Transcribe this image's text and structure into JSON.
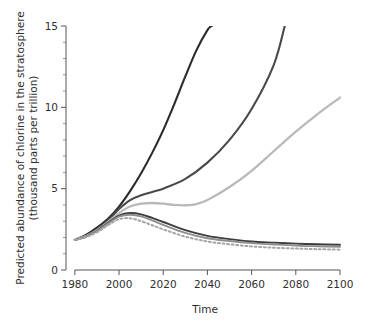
{
  "chart_data": {
    "type": "line",
    "title": "",
    "subtitle": "",
    "xlabel": "Time",
    "ylabel": "Predicted abundance of chlorine in the stratosphere (thousand parts per trillion)",
    "ylabel_line1": "Predicted abundance of chlorine in the stratosphere",
    "ylabel_line2": "(thousand parts per trillion)",
    "xlim": [
      1976,
      2100
    ],
    "ylim": [
      0,
      15
    ],
    "xticks": [
      1980,
      2000,
      2020,
      2040,
      2060,
      2080,
      2100
    ],
    "xtick_labels": [
      "1980",
      "2000",
      "2020",
      "2040",
      "2060",
      "2080",
      "2100"
    ],
    "yticks": [
      0,
      5,
      10,
      15
    ],
    "ytick_labels": [
      "0",
      "5",
      "10",
      "15"
    ],
    "yticks_minor": [
      1,
      2,
      3,
      4,
      6,
      7,
      8,
      9,
      11,
      12,
      13,
      14
    ],
    "grid": false,
    "legend": "none",
    "legend_position": "none",
    "series": [
      {
        "name": "no-protocol",
        "color": "#2b2b2b",
        "width": 2.1,
        "dash": "none",
        "clipped_at_top": true,
        "x": [
          1980,
          1985,
          1990,
          1995,
          2000,
          2005,
          2010,
          2015,
          2020,
          2025,
          2030,
          2035,
          2040,
          2042
        ],
        "y": [
          1.85,
          2.15,
          2.6,
          3.15,
          3.9,
          4.85,
          5.95,
          7.2,
          8.6,
          10.2,
          11.9,
          13.5,
          14.75,
          15.0
        ]
      },
      {
        "name": "montreal-1987",
        "color": "#4a4a4a",
        "width": 2.1,
        "dash": "none",
        "clipped_at_top": true,
        "x": [
          1980,
          1985,
          1990,
          1995,
          2000,
          2005,
          2010,
          2015,
          2020,
          2030,
          2040,
          2050,
          2060,
          2070,
          2075
        ],
        "y": [
          1.85,
          2.1,
          2.5,
          3.05,
          3.75,
          4.3,
          4.6,
          4.8,
          5.0,
          5.6,
          6.6,
          8.0,
          9.9,
          12.6,
          15.0
        ]
      },
      {
        "name": "london-1990",
        "color": "#b9b9b9",
        "width": 2.3,
        "dash": "none",
        "clipped_at_top": false,
        "x": [
          1980,
          1985,
          1990,
          1995,
          2000,
          2005,
          2010,
          2015,
          2020,
          2025,
          2030,
          2035,
          2040,
          2050,
          2060,
          2070,
          2080,
          2090,
          2100
        ],
        "y": [
          1.85,
          2.08,
          2.45,
          2.95,
          3.5,
          3.9,
          4.08,
          4.12,
          4.08,
          4.0,
          3.98,
          4.05,
          4.3,
          5.1,
          6.1,
          7.3,
          8.5,
          9.6,
          10.6
        ]
      },
      {
        "name": "copenhagen-1992",
        "color": "#3d3d3d",
        "width": 1.9,
        "dash": "none",
        "clipped_at_top": false,
        "x": [
          1980,
          1985,
          1990,
          1995,
          2000,
          2005,
          2010,
          2015,
          2020,
          2030,
          2040,
          2050,
          2060,
          2070,
          2080,
          2090,
          2100
        ],
        "y": [
          1.85,
          2.05,
          2.4,
          2.9,
          3.35,
          3.5,
          3.42,
          3.2,
          2.95,
          2.45,
          2.1,
          1.9,
          1.75,
          1.68,
          1.62,
          1.58,
          1.55
        ]
      },
      {
        "name": "vienna-1995",
        "color": "#8e8e8e",
        "width": 1.9,
        "dash": "none",
        "clipped_at_top": false,
        "x": [
          1980,
          1985,
          1990,
          1995,
          2000,
          2005,
          2010,
          2015,
          2020,
          2030,
          2040,
          2050,
          2060,
          2070,
          2080,
          2090,
          2100
        ],
        "y": [
          1.85,
          2.05,
          2.38,
          2.85,
          3.28,
          3.4,
          3.3,
          3.05,
          2.78,
          2.28,
          1.95,
          1.78,
          1.65,
          1.57,
          1.5,
          1.46,
          1.43
        ]
      },
      {
        "name": "zero-emissions",
        "color": "#a6a6a6",
        "width": 2.0,
        "dash": "2,2.6",
        "clipped_at_top": false,
        "x": [
          1980,
          1985,
          1990,
          1995,
          2000,
          2005,
          2010,
          2015,
          2020,
          2030,
          2040,
          2050,
          2060,
          2070,
          2080,
          2090,
          2100
        ],
        "y": [
          1.85,
          2.02,
          2.32,
          2.75,
          3.12,
          3.18,
          3.0,
          2.75,
          2.5,
          2.05,
          1.75,
          1.58,
          1.45,
          1.37,
          1.32,
          1.28,
          1.25
        ]
      }
    ]
  },
  "axes": {
    "y_title_line1": "Predicted abundance of chlorine in the stratosphere",
    "y_title_line2": "(thousand parts per trillion)",
    "x_title": "Time"
  }
}
